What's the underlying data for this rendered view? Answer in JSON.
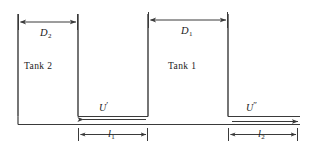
{
  "figure": {
    "type": "engineering-schematic",
    "background_color": "#ffffff",
    "line_color": "#3a3a3a",
    "text_color": "#1a1a1a"
  },
  "tanks": [
    {
      "id": "tank-2",
      "label": "Tank 2",
      "diameter_label": "D",
      "diameter_subscript": "2",
      "left_x": 18,
      "right_x": 78,
      "top_y": 14,
      "bottom_y": 116
    },
    {
      "id": "tank-1",
      "label": "Tank 1",
      "diameter_label": "D",
      "diameter_subscript": "1",
      "left_x": 148,
      "right_x": 228,
      "top_y": 14,
      "bottom_y": 116
    }
  ],
  "velocities": [
    {
      "id": "u-prime",
      "symbol": "U",
      "primes": "′",
      "direction": "left",
      "arrow_from_x": 228,
      "arrow_to_x": 88,
      "arrow_y": 118
    },
    {
      "id": "u-double-prime",
      "symbol": "U",
      "primes": "″",
      "direction": "right",
      "arrow_from_x": 150,
      "arrow_to_x": 300,
      "arrow_y": 120
    }
  ],
  "length_dimensions": [
    {
      "id": "l1",
      "symbol": "l",
      "subscript": "1",
      "from_x": 78,
      "to_x": 148,
      "y": 134
    },
    {
      "id": "l2",
      "symbol": "l",
      "subscript": "2",
      "from_x": 228,
      "to_x": 298,
      "y": 134
    }
  ],
  "diameter_dimensions": [
    {
      "id": "d2",
      "from_x": 18,
      "to_x": 78,
      "y": 22
    },
    {
      "id": "d1",
      "from_x": 148,
      "to_x": 228,
      "y": 20
    }
  ]
}
